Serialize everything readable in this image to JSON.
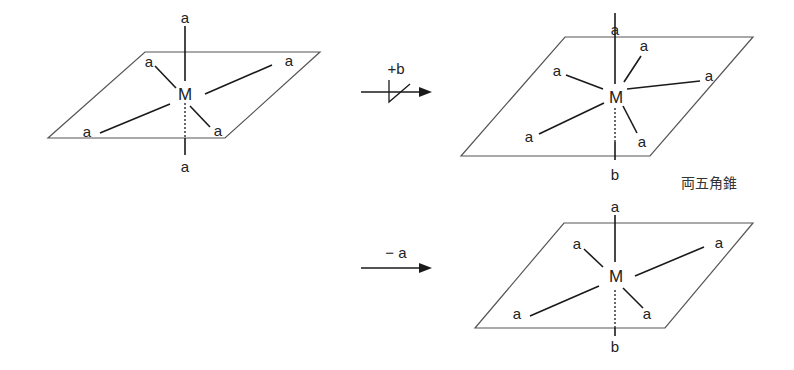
{
  "diagram": {
    "type": "reaction-scheme",
    "colors": {
      "line": "#1a1a1a",
      "plane": "#555555",
      "text": "#222222",
      "background": "#ffffff"
    },
    "start": {
      "center": "M",
      "ligands": [
        "a",
        "a",
        "a",
        "a",
        "a",
        "a"
      ],
      "axial_top": "a",
      "axial_bottom": "a"
    },
    "arrow_top": {
      "label": "+b",
      "blocked": true
    },
    "product_top": {
      "center": "M",
      "ligands": [
        "a",
        "a",
        "a",
        "a",
        "a",
        "a",
        "b"
      ],
      "axial_top": "a",
      "axial_bottom": "b",
      "caption": "両五角錐"
    },
    "arrow_bottom": {
      "label": "− a",
      "blocked": false
    },
    "product_bottom": {
      "center": "M",
      "ligands": [
        "a",
        "a",
        "a",
        "a",
        "a",
        "b"
      ],
      "axial_top": "a",
      "axial_bottom": "b"
    }
  }
}
